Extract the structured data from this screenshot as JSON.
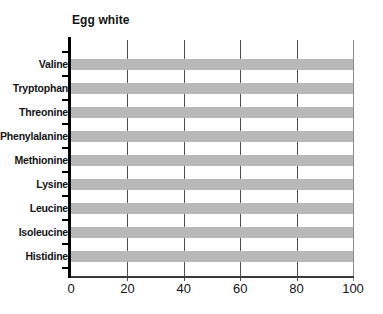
{
  "chart_data": {
    "type": "bar",
    "orientation": "horizontal",
    "title": "Egg white",
    "categories": [
      "Valine",
      "Tryptophan",
      "Threonine",
      "Phenylalanine",
      "Methionine",
      "Lysine",
      "Leucine",
      "Isoleucine",
      "Histidine"
    ],
    "values": [
      100,
      100,
      100,
      100,
      100,
      100,
      100,
      100,
      100
    ],
    "xlabel": "",
    "ylabel": "",
    "xlim": [
      0,
      100
    ],
    "xticks": [
      0,
      20,
      40,
      60,
      80,
      100
    ],
    "grid": true,
    "legend": false,
    "bar_color": "#b8b9b8",
    "gridline_color": "#4f4f4f",
    "edge_line_color": "#8a8a8a",
    "axis_color": "#000000",
    "text_color": "#141414",
    "background_color": "#ffffff"
  }
}
